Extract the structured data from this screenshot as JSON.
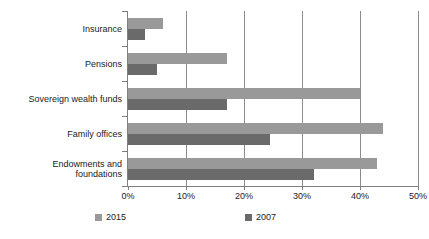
{
  "chart_data": {
    "type": "bar",
    "orientation": "horizontal",
    "title": "",
    "xlabel": "",
    "ylabel": "",
    "xlim": [
      0,
      50
    ],
    "xtick_labels": [
      "0%",
      "10%",
      "20%",
      "30%",
      "40%",
      "50%"
    ],
    "xtick_values": [
      0,
      10,
      20,
      30,
      40,
      50
    ],
    "grid": "vertical",
    "legend_position": "bottom",
    "categories": [
      "Insurance",
      "Pensions",
      "Sovereign wealth funds",
      "Family offices",
      "Endowments and foundations"
    ],
    "category_lines": [
      [
        "Insurance"
      ],
      [
        "Pensions"
      ],
      [
        "Sovereign wealth funds"
      ],
      [
        "Family offices"
      ],
      [
        "Endowments and",
        "foundations"
      ]
    ],
    "series": [
      {
        "name": "2015",
        "color": "#999999",
        "values": [
          6,
          17,
          40,
          44,
          43
        ]
      },
      {
        "name": "2007",
        "color": "#6a6a6a",
        "values": [
          3,
          5,
          17,
          24.5,
          32
        ]
      }
    ]
  },
  "legend": {
    "items": [
      {
        "label": "2015",
        "color": "#999999"
      },
      {
        "label": "2007",
        "color": "#6a6a6a"
      }
    ]
  }
}
